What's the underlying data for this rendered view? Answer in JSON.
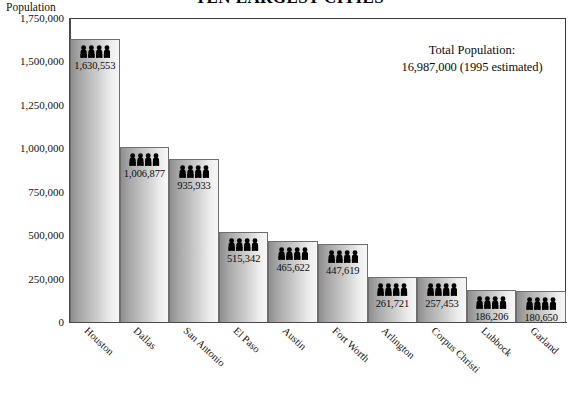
{
  "chart_title": "TEN LARGEST CITIES",
  "y_axis_title": "Population",
  "annotation": {
    "label": "Total Population:",
    "value": "16,987,000  (1995 estimated)"
  },
  "icon": {
    "name": "people-group-icon",
    "count_per_bar": 4
  },
  "colors": {
    "bar_dark": "#8e8e8e",
    "bar_light": "#f7f7f7",
    "bar_border": "#6e6e6e",
    "axis": "#4a4a4a",
    "text": "#111111",
    "background": "#ffffff"
  },
  "chart_data": {
    "type": "bar",
    "title": "TEN LARGEST CITIES",
    "xlabel": "",
    "ylabel": "Population",
    "ylim": [
      0,
      1750000
    ],
    "grid": false,
    "legend": null,
    "y_ticks": [
      0,
      250000,
      500000,
      750000,
      1000000,
      1250000,
      1500000,
      1750000
    ],
    "y_tick_labels": [
      "0",
      "250,000",
      "500,000",
      "750,000",
      "1,000,000",
      "1,250,000",
      "1,500,000",
      "1,750,000"
    ],
    "categories": [
      "Houston",
      "Dallas",
      "San Antonio",
      "El Paso",
      "Austin",
      "Fort Worth",
      "Arlington",
      "Corpus Christi",
      "Lubbock",
      "Garland"
    ],
    "values": [
      1630553,
      1006877,
      935933,
      515342,
      465622,
      447619,
      261721,
      257453,
      186206,
      180650
    ],
    "value_labels": [
      "1,630,553",
      "1,006,877",
      "935,933",
      "515,342",
      "465,622",
      "447,619",
      "261,721",
      "257,453",
      "186,206",
      "180,650"
    ],
    "annotations": [
      "Total Population:",
      "16,987,000  (1995 estimated)"
    ]
  }
}
